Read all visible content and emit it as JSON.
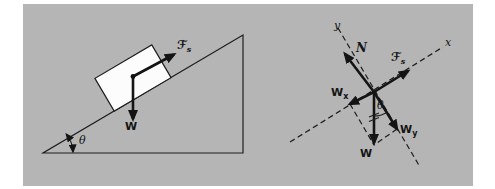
{
  "figure": {
    "colors": {
      "panel_bg": "#b5b5b5",
      "page_bg": "#ffffff",
      "ink": "#1e1e1e"
    },
    "incline": {
      "friction_label": {
        "main": "ℱ",
        "sub": "s"
      },
      "weight_label": "W",
      "angle_label": "θ"
    },
    "fbd": {
      "y_axis_label": "y",
      "x_axis_label": "x",
      "normal_label": "N",
      "friction_label": {
        "main": "ℱ",
        "sub": "s"
      },
      "weight_x_label": {
        "main": "W",
        "sub": "x"
      },
      "weight_y_label": {
        "main": "W",
        "sub": "y"
      },
      "weight_label": "W",
      "angle_label": "θ"
    }
  }
}
